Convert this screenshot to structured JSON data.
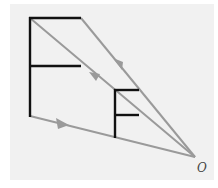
{
  "diagram": {
    "title": "",
    "object_label": "",
    "center_label": "O",
    "colors": {
      "object": "#111111",
      "ray": "#9a9a9a",
      "background": "#f1f1f1"
    },
    "big_f": {
      "stem": [
        30,
        18,
        30,
        116
      ],
      "top_bar": [
        30,
        18,
        81,
        18
      ],
      "mid_bar": [
        30,
        66,
        81,
        66
      ]
    },
    "small_f": {
      "stem": [
        115,
        90,
        115,
        138
      ],
      "top_bar": [
        115,
        90,
        139,
        90
      ],
      "mid_bar": [
        115,
        115,
        139,
        115
      ]
    },
    "center": [
      195,
      157
    ],
    "rays": [
      {
        "from": [
          81,
          18
        ],
        "to": [
          195,
          157
        ]
      },
      {
        "from": [
          30,
          18
        ],
        "to": [
          195,
          157
        ]
      },
      {
        "from": [
          30,
          116
        ],
        "to": [
          195,
          157
        ]
      }
    ]
  }
}
